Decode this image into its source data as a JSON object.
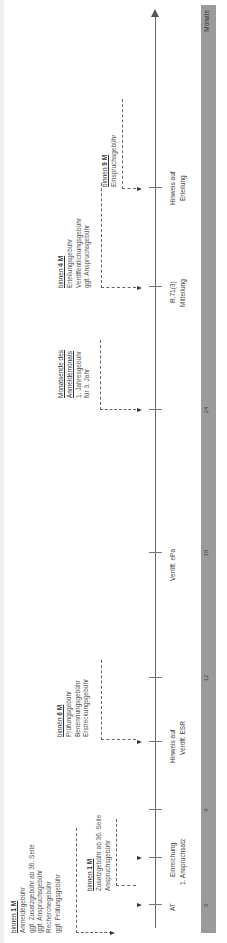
{
  "axis": {
    "unit_label": "Monate",
    "ticks": [
      {
        "label": "0",
        "x": 38
      },
      {
        "label": "6",
        "x": 133
      },
      {
        "label": "12",
        "x": 265
      },
      {
        "label": "18",
        "x": 390
      },
      {
        "label": "24",
        "x": 533
      }
    ]
  },
  "events": [
    {
      "id": "at",
      "x": 38,
      "lines": [
        "AT"
      ]
    },
    {
      "id": "einreichung",
      "x": 85,
      "lines": [
        "Einreichung",
        "1. Anspruchsatz"
      ]
    },
    {
      "id": "hinweis-esr",
      "x": 201,
      "lines": [
        "Hinweis auf",
        "Veröff. ESR"
      ]
    },
    {
      "id": "veroeff-epa",
      "x": 390,
      "lines": [
        "Veröff. ePa"
      ]
    },
    {
      "id": "r71",
      "x": 656,
      "lines": [
        "R.71(3)",
        "Mitteilung"
      ]
    },
    {
      "id": "hinweis-erteilung",
      "x": 755,
      "lines": [
        "Hinweis auf",
        "Erteilung"
      ]
    }
  ],
  "deadlines": [
    {
      "id": "binnen-1m-a",
      "head_prefix": "binnen ",
      "head_bold": "1 M",
      "lines": [
        "Anmeldegebühr",
        "ggf. Zusatzgebühr ab 36. Seite",
        "ggf. Anspruchsgebühr",
        "Recherchegebühr",
        "ggf. Prüfungsgebühr"
      ]
    },
    {
      "id": "binnen-1m-b",
      "head_prefix": "binnen ",
      "head_bold": "1 M",
      "lines": [
        "Zusatzgebühr ab 36. Seite",
        "Anspruchsgebühr"
      ]
    },
    {
      "id": "binnen-6m",
      "head_prefix": "binnen ",
      "head_bold": "6 M",
      "lines": [
        "Prüfungsgebühr",
        "Benennungsgebühr",
        "Erstreckungsgebühr"
      ]
    },
    {
      "id": "monatsende",
      "head_lines": [
        "Monatsende des",
        "Anmeldemonats"
      ],
      "lines": [
        "1. Jahresgebühr",
        "für 3. Jahr"
      ]
    },
    {
      "id": "binnen-4m",
      "head_prefix": "binnen ",
      "head_bold": "4 M",
      "lines": [
        "Erteilungsgebühr",
        "Veröffentlichungsgebühr",
        "ggf. Anspruchsgebühr"
      ]
    },
    {
      "id": "binnen-9m",
      "head_prefix": "binnen ",
      "head_bold": "9 M",
      "lines": [
        "Einspruchsgebühr"
      ]
    }
  ],
  "colors": {
    "axis_bar": "#9b9b9b",
    "line": "#666666",
    "text": "#555555"
  }
}
